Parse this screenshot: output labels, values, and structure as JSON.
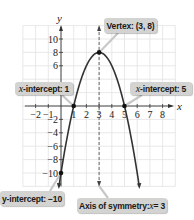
{
  "chart_data": {
    "type": "line",
    "title": "",
    "function": "y = -2(x - 3)^2 + 8",
    "xlabel": "x",
    "ylabel": "y",
    "xlim": [
      -3,
      8.5
    ],
    "ylim": [
      -12,
      12
    ],
    "grid": true,
    "x_tick_labels": [
      "-2",
      "-1",
      "1",
      "2",
      "3",
      "4",
      "5",
      "6",
      "7",
      "8"
    ],
    "y_tick_labels": [
      "10",
      "8",
      "6",
      "-2",
      "-4",
      "-6",
      "-8",
      "-10"
    ],
    "series": [
      {
        "name": "parabola",
        "x": [
          -0.146,
          0,
          1,
          2,
          3,
          4,
          5,
          6,
          6.146
        ],
        "y": [
          -11.8,
          -10,
          0,
          6,
          8,
          6,
          0,
          -10,
          -11.8
        ]
      }
    ],
    "points": [
      {
        "name": "vertex",
        "x": 3,
        "y": 8
      },
      {
        "name": "x-intercept-1",
        "x": 1,
        "y": 0
      },
      {
        "name": "x-intercept-5",
        "x": 5,
        "y": 0
      },
      {
        "name": "y-intercept",
        "x": 0,
        "y": -10
      }
    ],
    "axis_of_symmetry": 3,
    "annotations": [
      "Vertex: (3, 8)",
      "x-intercept: 1",
      "x-intercept: 5",
      "y-intercept: −10",
      "Axis of symmetry: x = 3"
    ]
  },
  "labels": {
    "vertex": "Vertex: (3, 8)",
    "xint1_var": "x",
    "xint1_text": "-intercept: 1",
    "xint5_var": "x",
    "xint5_text": "-intercept: 5",
    "yint_text": "y-intercept: −10",
    "axis_text": "Axis of symmetry: ",
    "axis_var": "x",
    "axis_eq": " = 3"
  },
  "axes": {
    "x_name": "x",
    "y_name": "y"
  },
  "ticks": {
    "x": [
      {
        "v": -2,
        "label": "−2"
      },
      {
        "v": -1,
        "label": "−1"
      },
      {
        "v": 1,
        "label": "1"
      },
      {
        "v": 2,
        "label": "2"
      },
      {
        "v": 3,
        "label": "3"
      },
      {
        "v": 4,
        "label": "4"
      },
      {
        "v": 5,
        "label": "5"
      },
      {
        "v": 6,
        "label": "6"
      },
      {
        "v": 7,
        "label": "7"
      },
      {
        "v": 8,
        "label": "8"
      }
    ],
    "y": [
      {
        "v": 10,
        "label": "10"
      },
      {
        "v": 8,
        "label": "8"
      },
      {
        "v": 6,
        "label": "6"
      },
      {
        "v": -2,
        "label": "−2"
      },
      {
        "v": -4,
        "label": "−4"
      },
      {
        "v": -6,
        "label": "−6"
      },
      {
        "v": -8,
        "label": "−8"
      },
      {
        "v": -10,
        "label": "−10"
      }
    ]
  },
  "colors": {
    "curve": "#333333",
    "grid": "#e2e2e2",
    "axis": "#333333",
    "callout_bg": "#d3d3d1"
  }
}
